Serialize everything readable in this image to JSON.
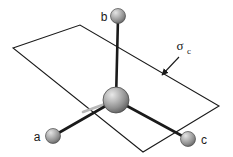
{
  "figure": {
    "type": "molecular-symmetry-diagram",
    "background_color": "#ffffff",
    "width": 233,
    "height": 157,
    "labels": {
      "atom_a": "a",
      "atom_b": "b",
      "atom_c": "c",
      "mirror_plane_symbol": "σ",
      "mirror_plane_subscript": "c"
    },
    "colors": {
      "line": "#1a1a1a",
      "sphere_light": "#d9d9d9",
      "sphere_mid": "#9a9a9a",
      "sphere_dark": "#6e6e6e",
      "sphere_edge": "#4a4a4a",
      "bond_dark": "#1a1a1a",
      "bond_faded": "#b8b8b8",
      "plane_edge": "#1a1a1a"
    },
    "plane": {
      "name": "sigma-c mirror plane",
      "corners": [
        {
          "x": 13,
          "y": 48
        },
        {
          "x": 80,
          "y": 25
        },
        {
          "x": 219,
          "y": 106
        },
        {
          "x": 143,
          "y": 152
        }
      ]
    },
    "atoms": [
      {
        "id": "central",
        "label": "",
        "cx": 116,
        "cy": 100,
        "r": 13
      },
      {
        "id": "b",
        "label": "b",
        "cx": 118,
        "cy": 16,
        "r": 7.5,
        "label_x": 104,
        "label_y": 20
      },
      {
        "id": "a",
        "label": "a",
        "cx": 53,
        "cy": 136,
        "r": 7.5,
        "label_x": 35,
        "label_y": 140
      },
      {
        "id": "c",
        "label": "c",
        "cx": 188,
        "cy": 139,
        "r": 7.5,
        "label_x": 201,
        "label_y": 144
      }
    ],
    "bonds": [
      {
        "id": "bond-central-b",
        "x1": 116,
        "y1": 100,
        "x2": 118,
        "y2": 16,
        "style": "solid"
      },
      {
        "id": "bond-central-a",
        "x1": 116,
        "y1": 100,
        "x2": 53,
        "y2": 136,
        "style": "solid"
      },
      {
        "id": "bond-central-c",
        "x1": 116,
        "y1": 100,
        "x2": 188,
        "y2": 139,
        "style": "solid"
      },
      {
        "id": "bond-central-back",
        "x1": 116,
        "y1": 100,
        "x2": 83,
        "y2": 112,
        "style": "faded"
      }
    ],
    "annotation": {
      "id": "sigma-c-annotation",
      "text_x": 181,
      "text_y": 50,
      "arrow_x1": 180,
      "arrow_y1": 56,
      "arrow_x2": 161,
      "arrow_y2": 76
    }
  }
}
